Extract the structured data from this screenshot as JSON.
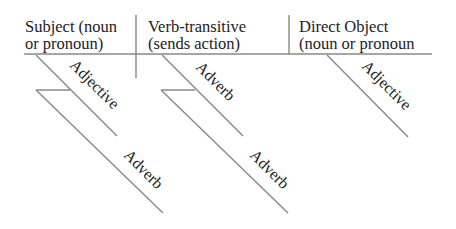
{
  "diagram": {
    "type": "sentence-diagram",
    "headers": [
      {
        "line1": "Subject (noun",
        "line2": "or pronoun)"
      },
      {
        "line1": "Verb-transitive",
        "line2": "(sends action)"
      },
      {
        "line1": "Direct Object",
        "line2": "(noun or pronoun"
      }
    ],
    "modifiers": {
      "subject_adjective": "Adjective",
      "subject_adverb": "Adverb",
      "verb_adverb_1": "Adverb",
      "verb_adverb_2": "Adverb",
      "object_adjective": "Adjective"
    },
    "colors": {
      "line": "#888888",
      "text": "#222222"
    }
  }
}
